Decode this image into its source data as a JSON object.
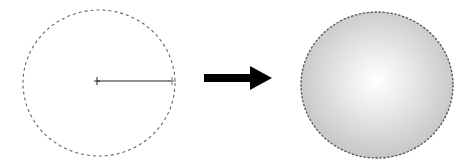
{
  "diagram": {
    "steps": [
      {
        "id": "before",
        "label": "Elliptical selection with gradient drag line",
        "selection": "marching-ants ellipse",
        "drag_line": "center to right edge",
        "fill": "none"
      },
      {
        "id": "transition",
        "label": "arrow",
        "icon": "right-arrow-icon"
      },
      {
        "id": "after",
        "label": "Radial gradient fill",
        "selection": "marching-ants ellipse",
        "fill": "radial-gradient",
        "gradient_colors": {
          "center": "#ffffff",
          "edge": "#c4c4c4"
        }
      }
    ],
    "colors": {
      "selection_outline": "#555555",
      "drag_line": "#222222",
      "arrow": "#000000"
    }
  }
}
